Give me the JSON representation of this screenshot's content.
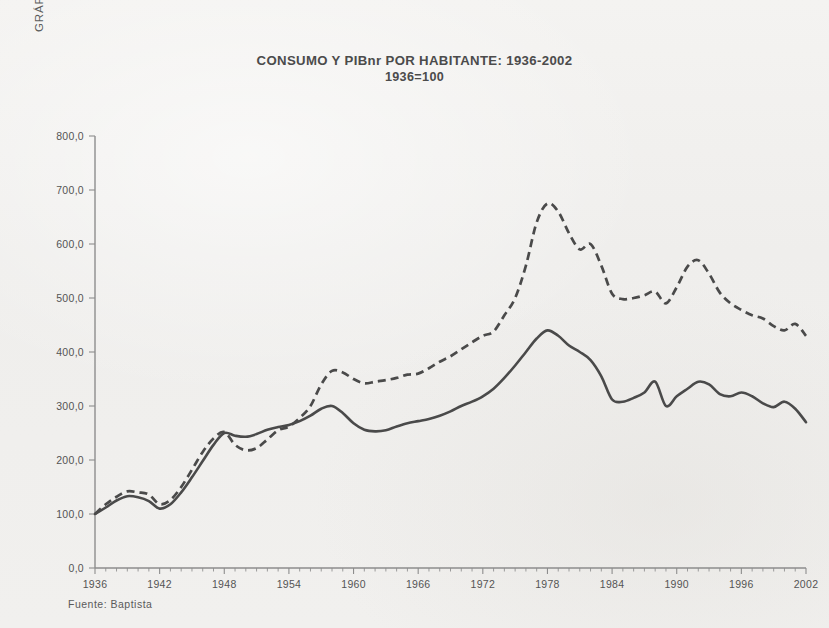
{
  "figure_label": "GRÁFICO 8",
  "source_note": "Fuente: Baptista",
  "chart_data": {
    "type": "line",
    "title": "CONSUMO Y PIBnr POR HABITANTE: 1936-2002",
    "subtitle": "1936=100",
    "xlabel": "",
    "ylabel": "",
    "xlim": [
      1936,
      2002
    ],
    "ylim": [
      0,
      800
    ],
    "grid": false,
    "legend": "none",
    "y_ticks": [
      0,
      100,
      200,
      300,
      400,
      500,
      600,
      700,
      800
    ],
    "y_tick_labels": [
      "0,0",
      "100,0",
      "200,0",
      "300,0",
      "400,0",
      "500,0",
      "600,0",
      "700,0",
      "800,0"
    ],
    "x_ticks": [
      1936,
      1942,
      1948,
      1954,
      1960,
      1966,
      1972,
      1978,
      1984,
      1990,
      1996,
      2002
    ],
    "x_tick_labels": [
      "1936",
      "1942",
      "1948",
      "1954",
      "1960",
      "1966",
      "1972",
      "1978",
      "1984",
      "1990",
      "1996",
      "2002"
    ],
    "x": [
      1936,
      1937,
      1938,
      1939,
      1940,
      1941,
      1942,
      1943,
      1944,
      1945,
      1946,
      1947,
      1948,
      1949,
      1950,
      1951,
      1952,
      1953,
      1954,
      1955,
      1956,
      1957,
      1958,
      1959,
      1960,
      1961,
      1962,
      1963,
      1964,
      1965,
      1966,
      1967,
      1968,
      1969,
      1970,
      1971,
      1972,
      1973,
      1974,
      1975,
      1976,
      1977,
      1978,
      1979,
      1980,
      1981,
      1982,
      1983,
      1984,
      1985,
      1986,
      1987,
      1988,
      1989,
      1990,
      1991,
      1992,
      1993,
      1994,
      1995,
      1996,
      1997,
      1998,
      1999,
      2000,
      2001,
      2002
    ],
    "series": [
      {
        "name": "Consumo por habitante",
        "style": "solid",
        "values": [
          100,
          112,
          125,
          133,
          131,
          124,
          110,
          118,
          140,
          168,
          198,
          228,
          250,
          245,
          243,
          248,
          256,
          261,
          265,
          272,
          282,
          295,
          300,
          287,
          268,
          256,
          253,
          255,
          262,
          268,
          272,
          276,
          282,
          290,
          300,
          308,
          318,
          332,
          352,
          375,
          400,
          425,
          440,
          430,
          412,
          400,
          385,
          355,
          312,
          308,
          315,
          325,
          345,
          300,
          318,
          332,
          345,
          340,
          322,
          318,
          325,
          318,
          305,
          298,
          308,
          295,
          270
        ]
      },
      {
        "name": "PIBnr por habitante",
        "style": "dashed",
        "values": [
          100,
          118,
          132,
          142,
          140,
          136,
          118,
          126,
          150,
          182,
          215,
          240,
          252,
          228,
          218,
          222,
          238,
          255,
          262,
          278,
          300,
          340,
          365,
          362,
          350,
          342,
          345,
          348,
          352,
          358,
          360,
          370,
          382,
          392,
          405,
          418,
          430,
          438,
          468,
          500,
          560,
          640,
          675,
          660,
          620,
          590,
          600,
          560,
          508,
          498,
          500,
          505,
          512,
          490,
          520,
          558,
          570,
          545,
          510,
          490,
          478,
          468,
          462,
          448,
          440,
          452,
          430
        ]
      }
    ]
  }
}
